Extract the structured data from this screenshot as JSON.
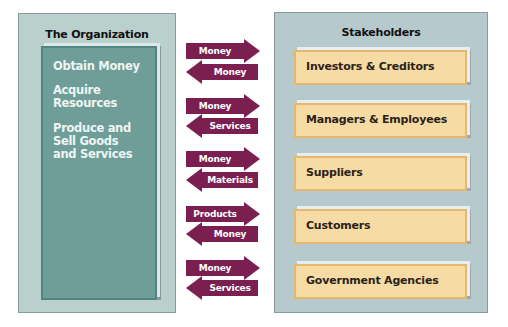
{
  "organization": {
    "title": "The Organization",
    "activities": [
      "Obtain Money",
      "Acquire\nResources",
      "Produce and\nSell Goods\nand Services"
    ]
  },
  "stakeholders": {
    "title": "Stakeholders",
    "items": [
      "Investors & Creditors",
      "Managers & Employees",
      "Suppliers",
      "Customers",
      "Government Agencies"
    ]
  },
  "exchanges": [
    {
      "to_stakeholder": "Money",
      "to_organization": "Money"
    },
    {
      "to_stakeholder": "Money",
      "to_organization": "Services"
    },
    {
      "to_stakeholder": "Money",
      "to_organization": "Materials"
    },
    {
      "to_stakeholder": "Products",
      "to_organization": "Money"
    },
    {
      "to_stakeholder": "Money",
      "to_organization": "Services"
    }
  ],
  "colors": {
    "arrow": "#7a1f4f",
    "org_inner": "#6f9e98",
    "stakeholder_box": "#f6dca4",
    "panel": "#b6c9cc"
  }
}
